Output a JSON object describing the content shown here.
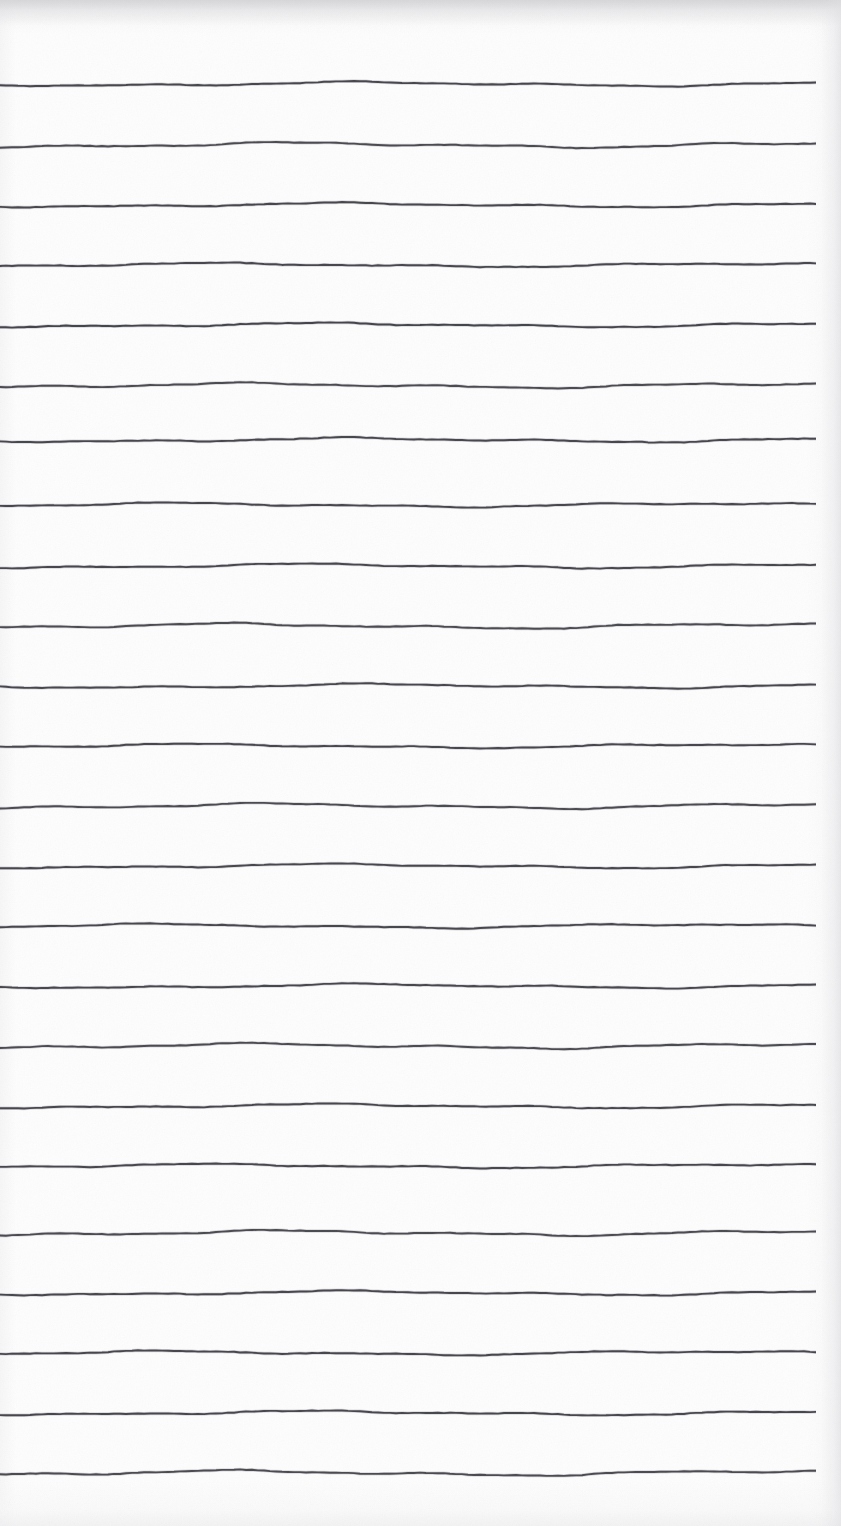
{
  "document": {
    "kind": "ruled-paper-scan",
    "title": "Blank ruled notebook paper",
    "page_width": 841,
    "page_height": 1526,
    "paper_color": "#fdfdfd",
    "rule_color": "#3c3c44",
    "rule_stroke_width": 1.9,
    "content_text": "",
    "notes": "Scanned sheet of blank lined paper. No text, headings, labels or numbers are present anywhere on the page."
  },
  "rules": {
    "count": 24,
    "left_x": 0,
    "right_x": 816,
    "line_length": 816,
    "nominal_spacing": 60.2,
    "first_line_y": 84,
    "last_line_y": 1462,
    "lines": [
      {
        "index": 1,
        "y": 84,
        "amplitude": 3.0,
        "phase": 0.3,
        "opacity": 0.93
      },
      {
        "index": 2,
        "y": 145,
        "amplitude": 3.6,
        "phase": 1.1,
        "opacity": 0.9
      },
      {
        "index": 3,
        "y": 205,
        "amplitude": 3.0,
        "phase": 0.55,
        "opacity": 0.93
      },
      {
        "index": 4,
        "y": 265,
        "amplitude": 2.8,
        "phase": 2.1,
        "opacity": 0.92
      },
      {
        "index": 5,
        "y": 325,
        "amplitude": 3.0,
        "phase": 0.8,
        "opacity": 0.94
      },
      {
        "index": 6,
        "y": 385,
        "amplitude": 3.4,
        "phase": 1.7,
        "opacity": 0.9
      },
      {
        "index": 7,
        "y": 440,
        "amplitude": 3.0,
        "phase": 0.4,
        "opacity": 0.93
      },
      {
        "index": 8,
        "y": 505,
        "amplitude": 2.9,
        "phase": 2.6,
        "opacity": 0.93
      },
      {
        "index": 9,
        "y": 566,
        "amplitude": 3.0,
        "phase": 0.95,
        "opacity": 0.93
      },
      {
        "index": 10,
        "y": 626,
        "amplitude": 3.6,
        "phase": 1.95,
        "opacity": 0.9
      },
      {
        "index": 11,
        "y": 686,
        "amplitude": 3.0,
        "phase": 0.15,
        "opacity": 0.93
      },
      {
        "index": 12,
        "y": 746,
        "amplitude": 2.9,
        "phase": 2.35,
        "opacity": 0.93
      },
      {
        "index": 13,
        "y": 806,
        "amplitude": 3.6,
        "phase": 1.4,
        "opacity": 0.9
      },
      {
        "index": 14,
        "y": 866,
        "amplitude": 3.0,
        "phase": 0.65,
        "opacity": 0.93
      },
      {
        "index": 15,
        "y": 926,
        "amplitude": 2.9,
        "phase": 2.85,
        "opacity": 0.93
      },
      {
        "index": 16,
        "y": 986,
        "amplitude": 3.0,
        "phase": 0.25,
        "opacity": 0.93
      },
      {
        "index": 17,
        "y": 1046,
        "amplitude": 3.6,
        "phase": 1.6,
        "opacity": 0.9
      },
      {
        "index": 18,
        "y": 1106,
        "amplitude": 3.0,
        "phase": 0.75,
        "opacity": 0.93
      },
      {
        "index": 19,
        "y": 1166,
        "amplitude": 2.9,
        "phase": 2.2,
        "opacity": 0.93
      },
      {
        "index": 20,
        "y": 1233,
        "amplitude": 3.6,
        "phase": 1.25,
        "opacity": 0.9
      },
      {
        "index": 21,
        "y": 1293,
        "amplitude": 3.0,
        "phase": 0.5,
        "opacity": 0.93
      },
      {
        "index": 22,
        "y": 1353,
        "amplitude": 2.9,
        "phase": 2.7,
        "opacity": 0.93
      },
      {
        "index": 23,
        "y": 1413,
        "amplitude": 3.0,
        "phase": 0.85,
        "opacity": 0.93
      },
      {
        "index": 24,
        "y": 1473,
        "amplitude": 3.6,
        "phase": 1.85,
        "opacity": 0.9
      }
    ]
  }
}
